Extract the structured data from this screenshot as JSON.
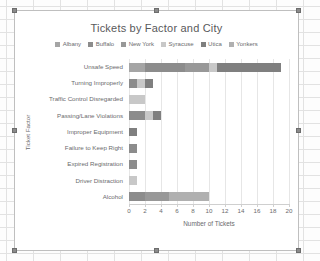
{
  "window": {
    "object_label": "embedded-chart-object",
    "selection_handles": 8
  },
  "chart_data": {
    "type": "bar",
    "orientation": "horizontal",
    "stacked": true,
    "title": "Tickets by Factor and City",
    "xlabel": "Number of Tickets",
    "ylabel": "Ticket Factor",
    "xlim": [
      0,
      20
    ],
    "xticks": [
      0,
      2,
      4,
      6,
      8,
      10,
      12,
      14,
      16,
      18,
      20
    ],
    "grid": true,
    "legend_position": "top",
    "categories": [
      "Unsafe Speed",
      "Turning Improperly",
      "Traffic Control Disregarded",
      "Passing/Lane Violations",
      "Improper Equipment",
      "Failure to Keep Right",
      "Expired Registration",
      "Driver Distraction",
      "Alcohol"
    ],
    "series": [
      {
        "name": "Albany",
        "color": "#a5a5a5",
        "values": [
          2,
          0,
          0,
          0,
          0,
          0,
          0,
          0,
          0
        ]
      },
      {
        "name": "Buffalo",
        "color": "#8c8c8c",
        "values": [
          5,
          1,
          0,
          2,
          0,
          1,
          1,
          0,
          2
        ]
      },
      {
        "name": "New York",
        "color": "#989898",
        "values": [
          3,
          0,
          0,
          0,
          0,
          0,
          0,
          0,
          3
        ]
      },
      {
        "name": "Syracuse",
        "color": "#c8c8c8",
        "values": [
          1,
          1,
          2,
          1,
          0,
          0,
          0,
          1,
          0
        ]
      },
      {
        "name": "Utica",
        "color": "#7f7f7f",
        "values": [
          8,
          1,
          0,
          1,
          1,
          0,
          0,
          0,
          0
        ]
      },
      {
        "name": "Yonkers",
        "color": "#b0b0b0",
        "values": [
          0,
          0,
          0,
          0,
          0,
          0,
          0,
          0,
          5
        ]
      }
    ],
    "totals": [
      19,
      3,
      2,
      4,
      1,
      1,
      1,
      1,
      10
    ]
  }
}
